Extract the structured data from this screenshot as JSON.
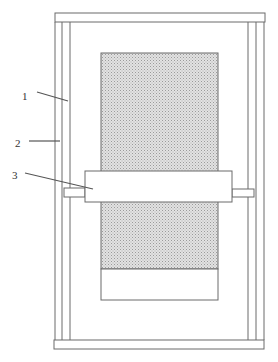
{
  "diagram": {
    "labels": [
      {
        "id": "1",
        "text": "1",
        "refers_to": "inner-frame-rail"
      },
      {
        "id": "2",
        "text": "2",
        "refers_to": "outer-frame-rail"
      },
      {
        "id": "3",
        "text": "3",
        "refers_to": "roller"
      }
    ],
    "colors": {
      "line": "#6a6a6a",
      "shade": "#d4d4d4",
      "background": "#ffffff"
    }
  }
}
